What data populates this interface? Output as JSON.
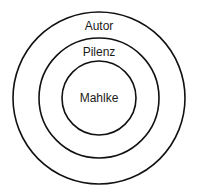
{
  "diagram": {
    "type": "concentric-circles",
    "center": [
      99,
      98
    ],
    "rings": [
      {
        "label": "Autor",
        "radius": 86,
        "label_y": 30
      },
      {
        "label": "Pilenz",
        "radius": 60,
        "label_y": 56
      },
      {
        "label": "Mahlke",
        "radius": 37,
        "label_y": 102
      }
    ],
    "stroke_color": "#111111",
    "text_color": "#1a1a1a"
  }
}
